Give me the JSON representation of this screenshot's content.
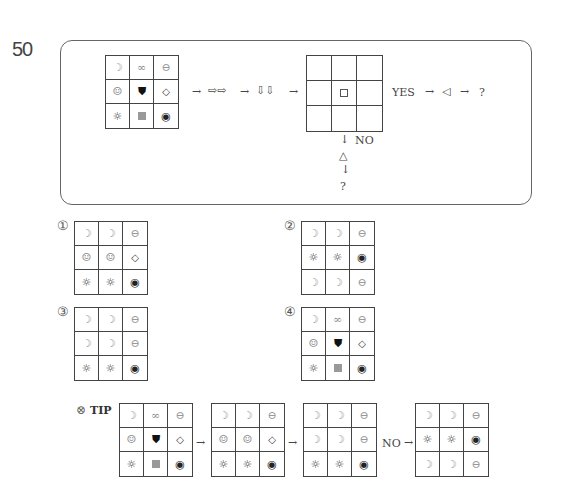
{
  "question": {
    "number": "50",
    "flow": {
      "arrow1": "→",
      "double_right": "⇨⇨",
      "arrow2": "→",
      "double_down": "⇩⇩",
      "arrow3": "→",
      "yes_label": "YES",
      "arrow4": "→",
      "left_triangle": "◁",
      "arrow5": "→",
      "yes_result": "?",
      "down_arrow1": "↓",
      "no_label": "NO",
      "up_triangle": "△",
      "down_arrow2": "↓",
      "no_result": "?"
    },
    "start_grid": [
      "moon",
      "infinity",
      "theta",
      "smile",
      "shield",
      "diamond",
      "sun",
      "gray-square",
      "target"
    ],
    "condition_grid": [
      "",
      "",
      "",
      "",
      "small-square",
      "",
      "",
      "",
      ""
    ]
  },
  "options": [
    {
      "label": "①",
      "grid": [
        "moon",
        "moon",
        "theta",
        "smile",
        "smile",
        "diamond",
        "sun",
        "sun",
        "target"
      ]
    },
    {
      "label": "②",
      "grid": [
        "moon",
        "moon",
        "theta",
        "sun",
        "sun",
        "target",
        "moon",
        "moon",
        "theta"
      ]
    },
    {
      "label": "③",
      "grid": [
        "moon",
        "moon",
        "theta",
        "moon",
        "moon",
        "theta",
        "sun",
        "sun",
        "target"
      ]
    },
    {
      "label": "④",
      "grid": [
        "moon",
        "infinity",
        "theta",
        "smile",
        "shield",
        "diamond",
        "sun",
        "gray-square",
        "target"
      ]
    }
  ],
  "tip": {
    "label": "TIP",
    "icon": "⊗",
    "arrow1": "→",
    "arrow2": "→",
    "no_label": "NO",
    "arrow3": "→",
    "steps": [
      [
        "moon",
        "infinity",
        "theta",
        "smile",
        "shield",
        "diamond",
        "sun",
        "gray-square",
        "target"
      ],
      [
        "moon",
        "moon",
        "theta",
        "smile",
        "smile",
        "diamond",
        "sun",
        "sun",
        "target"
      ],
      [
        "moon",
        "moon",
        "theta",
        "moon",
        "moon",
        "theta",
        "sun",
        "sun",
        "target"
      ],
      [
        "moon",
        "moon",
        "theta",
        "sun",
        "sun",
        "target",
        "moon",
        "moon",
        "theta"
      ]
    ]
  },
  "symbols": {
    "moon": "☽",
    "infinity": "∞",
    "theta": "⊖",
    "smile": "☺",
    "shield": "⛊",
    "diamond": "◇",
    "sun": "☼",
    "target": "◉"
  }
}
